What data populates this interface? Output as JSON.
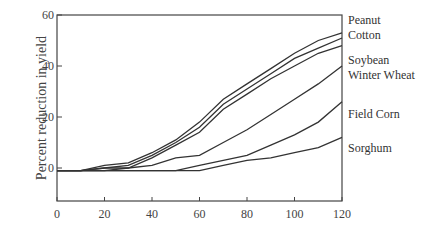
{
  "chart_data": {
    "type": "line",
    "title": "",
    "xlabel": "",
    "ylabel": "Percent reduction in yield",
    "xlim": [
      0,
      120
    ],
    "ylim": [
      -10,
      60
    ],
    "xticks": [
      0,
      20,
      40,
      60,
      80,
      100,
      120
    ],
    "yticks": [
      0,
      20,
      40,
      60
    ],
    "grid": false,
    "legend_position": "right, inline labels",
    "x": [
      0,
      10,
      20,
      30,
      40,
      50,
      60,
      70,
      80,
      90,
      100,
      110,
      120
    ],
    "series": [
      {
        "name": "Peanut",
        "values": [
          -1,
          -1,
          1,
          2,
          6,
          11,
          18,
          27,
          33,
          39,
          45,
          50,
          53
        ]
      },
      {
        "name": "Cotton",
        "values": [
          -1,
          -1,
          0,
          1,
          5,
          10,
          16,
          25,
          31,
          37,
          43,
          47,
          51
        ]
      },
      {
        "name": "Soybean",
        "values": [
          -1,
          -1,
          0,
          0,
          4,
          9,
          14,
          23,
          29,
          35,
          40,
          45,
          48
        ]
      },
      {
        "name": "Winter Wheat",
        "values": [
          -1,
          -1,
          -1,
          0,
          1,
          4,
          5,
          10,
          15,
          21,
          27,
          33,
          40
        ]
      },
      {
        "name": "Field Corn",
        "values": [
          -1,
          -1,
          -1,
          -1,
          -1,
          -1,
          1,
          3,
          5,
          9,
          13,
          18,
          26
        ]
      },
      {
        "name": "Sorghum",
        "values": [
          -1,
          -1,
          -1,
          -1,
          -1,
          -1,
          -1,
          1,
          3,
          4,
          6,
          8,
          12
        ]
      }
    ]
  },
  "labels": {
    "y_axis": "Percent reduction in yield",
    "series": [
      "Peanut",
      "Cotton",
      "Soybean",
      "Winter Wheat",
      "Field Corn",
      "Sorghum"
    ]
  }
}
